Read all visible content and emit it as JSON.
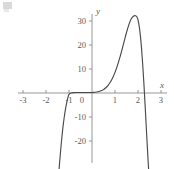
{
  "figure": {
    "background_color": "#ffffff",
    "curve_color": "#4a4a4a",
    "axis_color": "#8a8a8a",
    "label_color": "#5a5a5a"
  },
  "axis_labels": {
    "x_name": "x",
    "y_name": "y"
  },
  "x_ticks": [
    {
      "label": "-3",
      "value": -3
    },
    {
      "label": "-2",
      "value": -2
    },
    {
      "label": "-1",
      "value": -1
    },
    {
      "label": "0",
      "value": 0
    },
    {
      "label": "1",
      "value": 1
    },
    {
      "label": "2",
      "value": 2
    },
    {
      "label": "3",
      "value": 3
    }
  ],
  "y_ticks": [
    {
      "label": "30",
      "value": 30
    },
    {
      "label": "20",
      "value": 20
    },
    {
      "label": "10",
      "value": 10
    },
    {
      "label": "-10",
      "value": -10
    },
    {
      "label": "-20",
      "value": -20
    }
  ],
  "chart_data": {
    "type": "line",
    "title": "",
    "subtitle": "",
    "xlabel": "x",
    "ylabel": "y",
    "xlim": [
      -3.2,
      3.2
    ],
    "ylim": [
      -26,
      34
    ],
    "grid": false,
    "legend": null,
    "legend_position": "none",
    "x_ticks": [
      -3,
      -2,
      -1,
      0,
      1,
      2,
      3
    ],
    "x_tick_labels": [
      "-3",
      "-2",
      "-1",
      "0",
      "1",
      "2",
      "3"
    ],
    "y_ticks": [
      -20,
      -10,
      10,
      20,
      30
    ],
    "y_tick_labels": [
      "-20",
      "-10",
      "10",
      "20",
      "30"
    ],
    "axes_style": "centered-cross",
    "annotations": [],
    "features": {
      "x_intercepts": [
        -1.0,
        2.35
      ],
      "local_maximum": {
        "x": 1.9,
        "y": 32
      },
      "flat_region": {
        "x_start": -1.0,
        "x_end": 0.7,
        "y": 0
      },
      "left_branch": "descends steeply below -25 for x < -1.25",
      "right_branch": "descends steeply below -25 for x > 2.45"
    },
    "series": [
      {
        "name": "curve",
        "color": "#4a4a4a",
        "x": [
          -1.45,
          -1.4,
          -1.35,
          -1.3,
          -1.25,
          -1.2,
          -1.15,
          -1.1,
          -1.05,
          -1.0,
          -0.9,
          -0.8,
          -0.7,
          -0.6,
          -0.5,
          -0.4,
          -0.3,
          -0.2,
          -0.1,
          0.0,
          0.1,
          0.2,
          0.3,
          0.4,
          0.5,
          0.6,
          0.7,
          0.8,
          0.9,
          1.0,
          1.1,
          1.2,
          1.3,
          1.4,
          1.5,
          1.6,
          1.7,
          1.8,
          1.9,
          1.95,
          2.0,
          2.05,
          2.1,
          2.15,
          2.2,
          2.25,
          2.3,
          2.35,
          2.4,
          2.45,
          2.5
        ],
        "y": [
          -34.0,
          -28.0,
          -22.5,
          -17.5,
          -13.2,
          -9.6,
          -6.5,
          -4.0,
          -2.0,
          -0.6,
          0.0,
          0.15,
          0.2,
          0.2,
          0.2,
          0.2,
          0.2,
          0.2,
          0.2,
          0.2,
          0.3,
          0.4,
          0.6,
          0.9,
          1.4,
          2.2,
          3.2,
          4.6,
          6.4,
          8.6,
          11.3,
          14.4,
          17.9,
          21.6,
          25.2,
          28.4,
          30.8,
          32.0,
          32.2,
          31.8,
          30.5,
          28.0,
          24.2,
          19.0,
          12.5,
          5.0,
          -3.5,
          -12.5,
          -21.5,
          -30.0,
          -38.0
        ]
      }
    ]
  }
}
